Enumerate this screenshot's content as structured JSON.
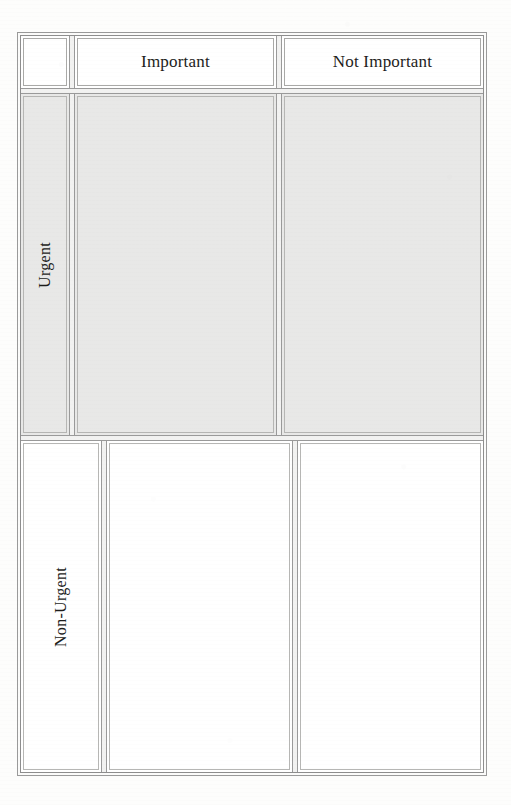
{
  "page": {
    "background_color": "#fdfdfc"
  },
  "matrix": {
    "corner_label": "",
    "columns": [
      {
        "key": "important",
        "label": "Important"
      },
      {
        "key": "not_important",
        "label": "Not Important"
      }
    ],
    "rows": [
      {
        "key": "urgent",
        "label": "Urgent",
        "shaded": true,
        "fill_color": "#e8e8e7"
      },
      {
        "key": "non_urgent",
        "label": "Non-Urgent",
        "shaded": false,
        "fill_color": "#ffffff"
      }
    ],
    "cells": [
      {
        "row": "urgent",
        "column": "important",
        "content": ""
      },
      {
        "row": "urgent",
        "column": "not_important",
        "content": ""
      },
      {
        "row": "non_urgent",
        "column": "important",
        "content": ""
      },
      {
        "row": "non_urgent",
        "column": "not_important",
        "content": ""
      }
    ],
    "colors": {
      "border_outer": "#9a9a9a",
      "border_inner": "#8e8e8e",
      "border_cell": "#b6b6b4",
      "gap_fill": "#f2f2f1",
      "text": "#1d1d1b"
    }
  }
}
